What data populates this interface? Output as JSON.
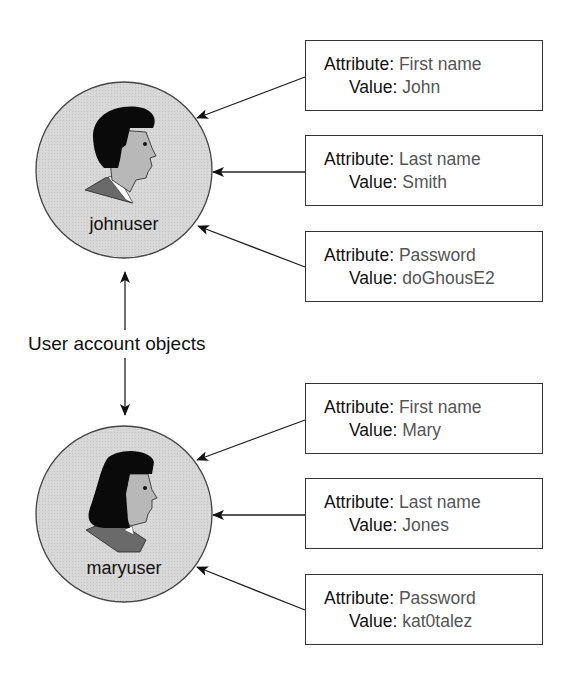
{
  "caption": "User account objects",
  "colors": {
    "circle_fill": "#d6d6d6",
    "stroke": "#333333",
    "label_text": "#111111",
    "value_text": "#555555"
  },
  "users": [
    {
      "name": "johnuser",
      "icon": "male-user-icon",
      "attributes": [
        {
          "label": "Attribute:",
          "attribute": "First name",
          "value_label": "Value:",
          "value": "John"
        },
        {
          "label": "Attribute:",
          "attribute": "Last name",
          "value_label": "Value:",
          "value": "Smith"
        },
        {
          "label": "Attribute:",
          "attribute": "Password",
          "value_label": "Value:",
          "value": "doGhousE2"
        }
      ]
    },
    {
      "name": "maryuser",
      "icon": "female-user-icon",
      "attributes": [
        {
          "label": "Attribute:",
          "attribute": "First name",
          "value_label": "Value:",
          "value": "Mary"
        },
        {
          "label": "Attribute:",
          "attribute": "Last name",
          "value_label": "Value:",
          "value": "Jones"
        },
        {
          "label": "Attribute:",
          "attribute": "Password",
          "value_label": "Value:",
          "value": "kat0talez"
        }
      ]
    }
  ]
}
